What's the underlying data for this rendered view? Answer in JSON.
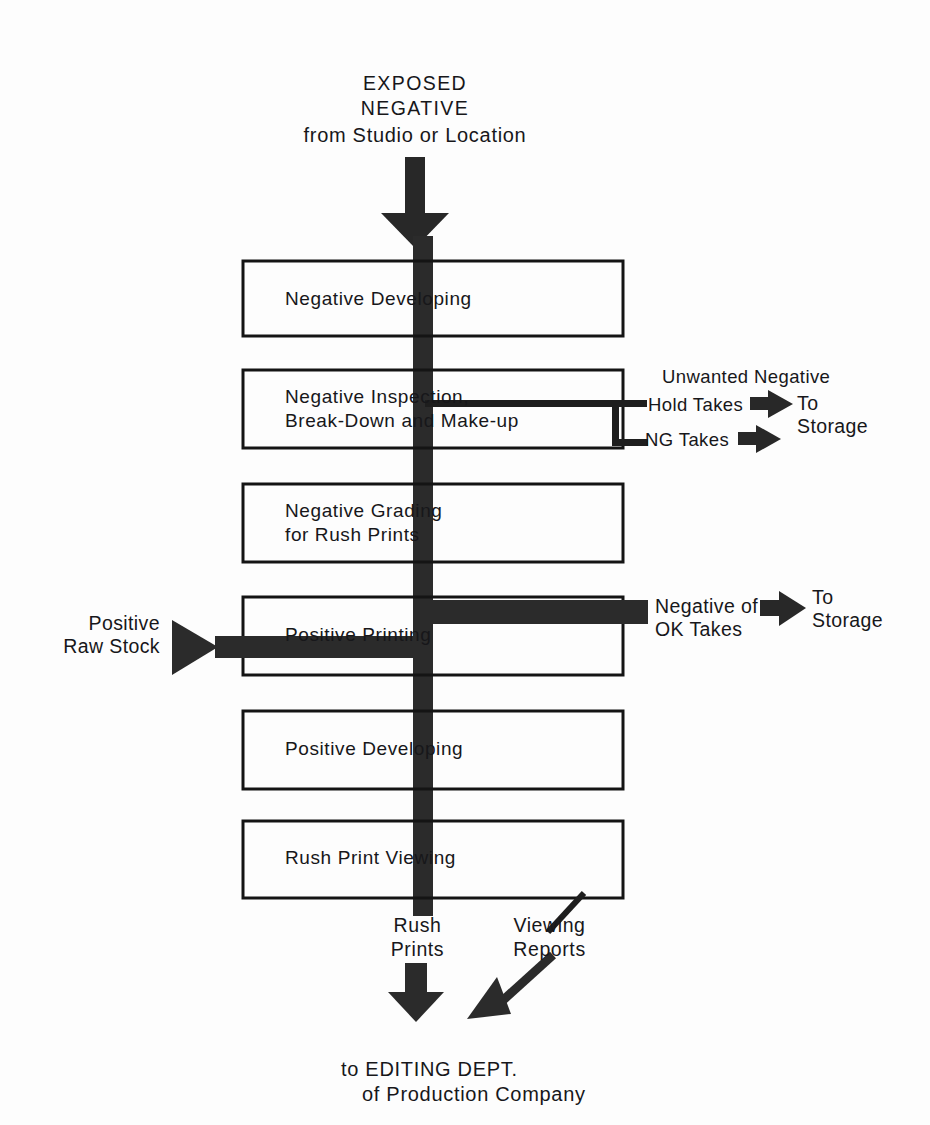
{
  "diagram": {
    "title_block": {
      "line1": "EXPOSED",
      "line2": "NEGATIVE",
      "line3": "from Studio or Location"
    },
    "process_boxes": [
      {
        "id": "negative-developing",
        "label": "Negative Developing"
      },
      {
        "id": "negative-inspection",
        "label": "Negative Inspection,\nBreak-Down and Make-up"
      },
      {
        "id": "negative-grading",
        "label": "Negative Grading\nfor Rush Prints"
      },
      {
        "id": "positive-printing",
        "label": "Positive Printing"
      },
      {
        "id": "positive-developing",
        "label": "Positive Developing"
      },
      {
        "id": "rush-print-viewing",
        "label": "Rush Print Viewing"
      }
    ],
    "branches": {
      "unwanted_negative_heading": "Unwanted Negative",
      "hold_takes": "Hold Takes",
      "ng_takes": "NG Takes",
      "to_storage_1": "To\nStorage",
      "negative_of_ok_takes": "Negative of\nOK Takes",
      "to_storage_2": "To\nStorage"
    },
    "inputs": {
      "positive_raw_stock": "Positive\nRaw Stock"
    },
    "outputs": {
      "rush_prints": "Rush\nPrints",
      "viewing_reports": "Viewing\nReports"
    },
    "footer": {
      "line1": "to EDITING DEPT.",
      "line2": "of Production Company"
    },
    "colors": {
      "ink": "#1a1a1a",
      "paper": "#fdfdfd",
      "arrow": "#282828"
    }
  }
}
